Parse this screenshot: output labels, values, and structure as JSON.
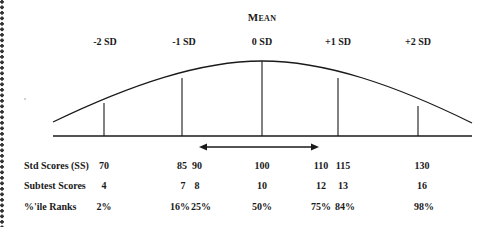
{
  "title": "Mean",
  "sd_labels": [
    "-2 SD",
    "-1 SD",
    "0 SD",
    "+1 SD",
    "+2 SD"
  ],
  "rows": [
    {
      "label": "Std Scores (SS)",
      "values": [
        "70",
        "85",
        "90",
        "100",
        "110",
        "115",
        "130"
      ]
    },
    {
      "label": "Subtest Scores",
      "values": [
        "4",
        "7",
        "8",
        "10",
        "12",
        "13",
        "16"
      ]
    },
    {
      "label": "%'ile Ranks",
      "values": [
        "2%",
        "16%",
        "25%",
        "50%",
        "75%",
        "84%",
        "98%"
      ]
    }
  ],
  "arrow": {
    "from_value": "90",
    "to_value": "110",
    "direction": "double-headed"
  },
  "colors": {
    "line": "#1a1a1a",
    "background": "#ffffff"
  }
}
